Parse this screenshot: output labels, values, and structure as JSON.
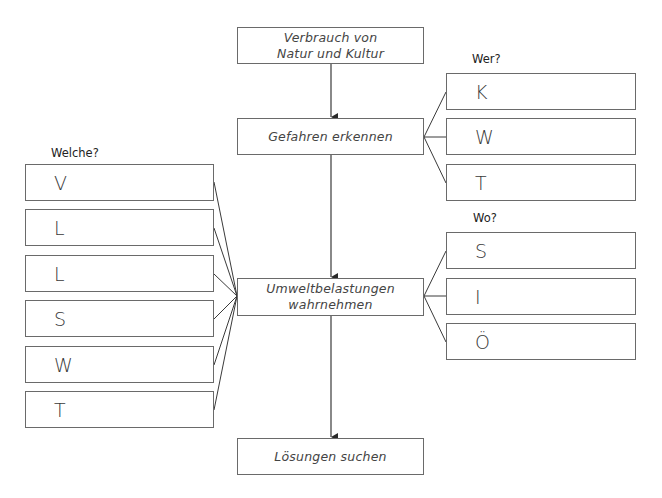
{
  "flow": {
    "steps": [
      {
        "label": "Verbrauch von Natur und Kultur",
        "lines": [
          "Verbrauch von",
          "Natur und Kultur"
        ]
      },
      {
        "label": "Gefahren erkennen",
        "lines": [
          "Gefahren erkennen"
        ]
      },
      {
        "label": "Umweltbelastungen wahrnehmen",
        "lines": [
          "Umweltbelastungen",
          "wahrnehmen"
        ]
      },
      {
        "label": "Lösungen suchen",
        "lines": [
          "Lösungen suchen"
        ]
      }
    ]
  },
  "groups": {
    "welche": {
      "label": "Welche?",
      "connects_to": "Umweltbelastungen wahrnehmen",
      "items": [
        "V",
        "L",
        "L",
        "S",
        "W",
        "T"
      ]
    },
    "wer": {
      "label": "Wer?",
      "connects_to": "Gefahren erkennen",
      "items": [
        "K",
        "W",
        "T"
      ]
    },
    "wo": {
      "label": "Wo?",
      "connects_to": "Umweltbelastungen wahrnehmen",
      "items": [
        "S",
        "I",
        "Ö"
      ]
    }
  },
  "colors": {
    "line": "#3a3a3a",
    "border": "#6a6a6a",
    "background": "#ffffff"
  }
}
